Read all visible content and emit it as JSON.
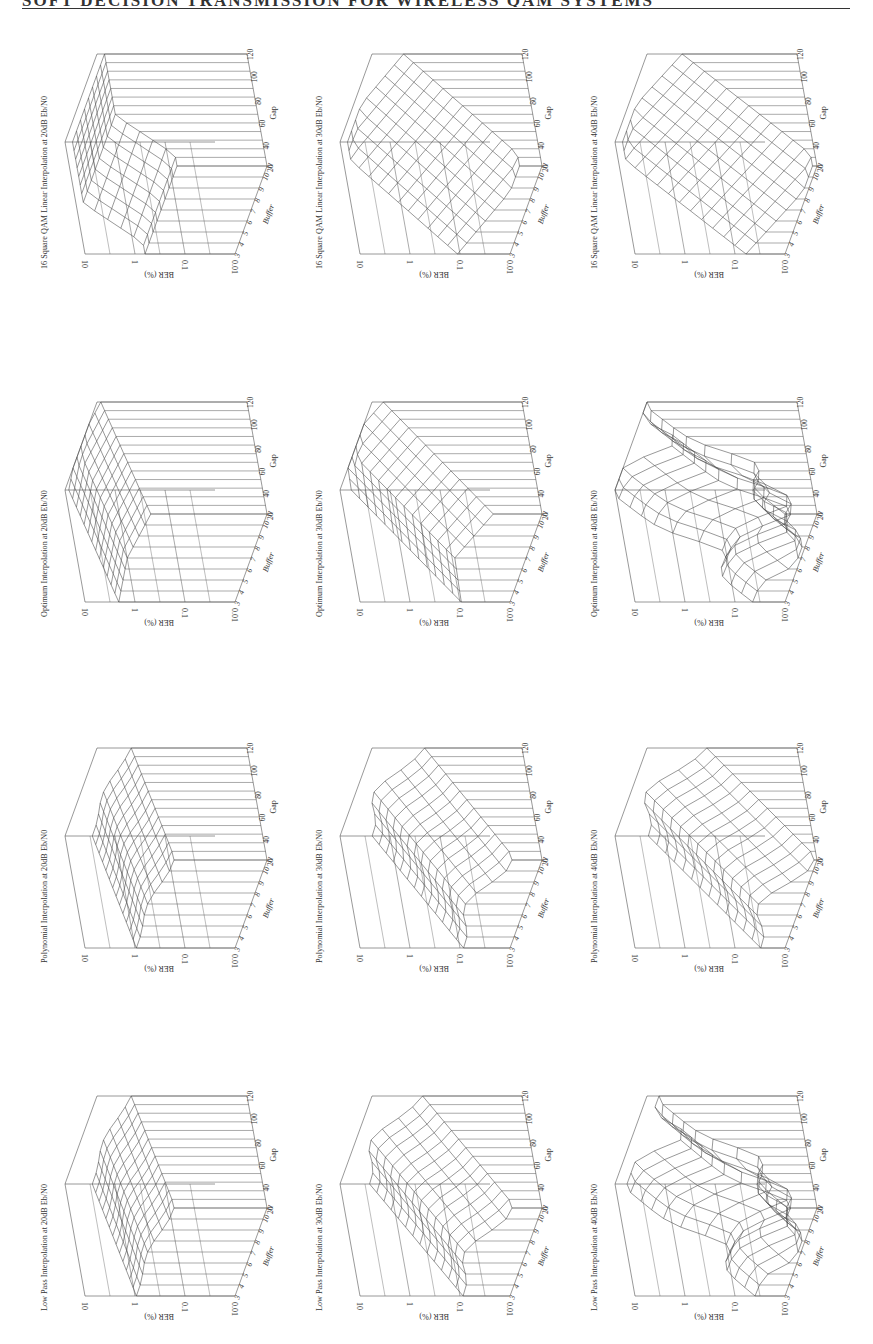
{
  "page": {
    "running_header": "SOFT DECISION TRANSMISSION FOR WIRELESS QAM SYSTEMS",
    "orientation": "landscape-rotated-90"
  },
  "axes": {
    "z_label": "BER (%)",
    "z_ticks": [
      "10",
      "1",
      "0.1",
      "0.01"
    ],
    "x_label": "Buffer",
    "x_ticks": [
      "3",
      "4",
      "5",
      "6",
      "7",
      "8",
      "9",
      "10",
      "11"
    ],
    "y_label": "Gap",
    "y_ticks": [
      "20",
      "40",
      "60",
      "80",
      "100",
      "120"
    ]
  },
  "plots": [
    {
      "id": "qam-20",
      "title": "16 Square QAM Linear Interpolation at 20dB Eb/N0",
      "row": 0,
      "col": 0,
      "origin": [
        35,
        44
      ],
      "floor": 0.6,
      "peak": 0.95,
      "shape": "plateau"
    },
    {
      "id": "qam-30",
      "title": "16 Square QAM Linear Interpolation at 30dB Eb/N0",
      "row": 0,
      "col": 1,
      "origin": [
        310,
        44
      ],
      "floor": 0.15,
      "peak": 0.95,
      "shape": "ramp"
    },
    {
      "id": "qam-40",
      "title": "16 Square QAM Linear Interpolation at 40dB Eb/N0",
      "row": 0,
      "col": 2,
      "origin": [
        585,
        44
      ],
      "floor": 0.03,
      "peak": 0.95,
      "shape": "ramp"
    },
    {
      "id": "opt-20",
      "title": "Optimum Interpolation at 20dB Eb/N0",
      "row": 1,
      "col": 0,
      "origin": [
        35,
        392
      ],
      "floor": 0.75,
      "peak": 1.0,
      "shape": "ridge"
    },
    {
      "id": "opt-30",
      "title": "Optimum Interpolation at 30dB Eb/N0",
      "row": 1,
      "col": 1,
      "origin": [
        310,
        392
      ],
      "floor": 0.25,
      "peak": 1.0,
      "shape": "ridge"
    },
    {
      "id": "opt-40",
      "title": "Optimum Interpolation at 40dB Eb/N0",
      "row": 1,
      "col": 2,
      "origin": [
        585,
        392
      ],
      "floor": 0.02,
      "peak": 1.0,
      "shape": "valley"
    },
    {
      "id": "poly-20",
      "title": "Polynomial Interpolation at 20dB Eb/N0",
      "row": 2,
      "col": 0,
      "origin": [
        35,
        738
      ],
      "floor": 0.62,
      "peak": 0.85,
      "shape": "hump"
    },
    {
      "id": "poly-30",
      "title": "Polynomial Interpolation at 30dB Eb/N0",
      "row": 2,
      "col": 1,
      "origin": [
        310,
        738
      ],
      "floor": 0.2,
      "peak": 0.88,
      "shape": "hump"
    },
    {
      "id": "poly-40",
      "title": "Polynomial Interpolation at 40dB Eb/N0",
      "row": 2,
      "col": 2,
      "origin": [
        585,
        738
      ],
      "floor": 0.02,
      "peak": 0.9,
      "shape": "hump"
    },
    {
      "id": "lp-20",
      "title": "Low Pass Interpolation at 20dB Eb/N0",
      "row": 3,
      "col": 0,
      "origin": [
        35,
        1086
      ],
      "floor": 0.62,
      "peak": 0.85,
      "shape": "hump"
    },
    {
      "id": "lp-30",
      "title": "Low Pass Interpolation at 30dB Eb/N0",
      "row": 3,
      "col": 1,
      "origin": [
        310,
        1086
      ],
      "floor": 0.2,
      "peak": 0.9,
      "shape": "hump"
    },
    {
      "id": "lp-40",
      "title": "Low Pass Interpolation at 40dB Eb/N0",
      "row": 3,
      "col": 2,
      "origin": [
        585,
        1086
      ],
      "floor": 0.02,
      "peak": 0.92,
      "shape": "valley"
    }
  ],
  "chart_data": [
    {
      "type": "surface3d",
      "title": "16 Square QAM Linear Interpolation at 20dB Eb/N0",
      "xlabel": "Buffer",
      "ylabel": "Gap",
      "zlabel": "BER (%)",
      "x": [
        3,
        4,
        5,
        6,
        7,
        8,
        9,
        10,
        11
      ],
      "y": [
        20,
        40,
        60,
        80,
        100,
        120
      ],
      "zscale": "log",
      "zlim": [
        0.01,
        10
      ],
      "approx_range": [
        0.5,
        3
      ]
    },
    {
      "type": "surface3d",
      "title": "16 Square QAM Linear Interpolation at 30dB Eb/N0",
      "xlabel": "Buffer",
      "ylabel": "Gap",
      "zlabel": "BER (%)",
      "x": [
        3,
        4,
        5,
        6,
        7,
        8,
        9,
        10,
        11
      ],
      "y": [
        20,
        40,
        60,
        80,
        100,
        120
      ],
      "zscale": "log",
      "zlim": [
        0.01,
        10
      ],
      "approx_range": [
        0.06,
        3
      ]
    },
    {
      "type": "surface3d",
      "title": "16 Square QAM Linear Interpolation at 40dB Eb/N0",
      "xlabel": "Buffer",
      "ylabel": "Gap",
      "zlabel": "BER (%)",
      "x": [
        3,
        4,
        5,
        6,
        7,
        8,
        9,
        10,
        11
      ],
      "y": [
        20,
        40,
        60,
        80,
        100,
        120
      ],
      "zscale": "log",
      "zlim": [
        0.01,
        10
      ],
      "approx_range": [
        0.01,
        3
      ]
    },
    {
      "type": "surface3d",
      "title": "Optimum Interpolation at 20dB Eb/N0",
      "xlabel": "Buffer",
      "ylabel": "Gap",
      "zlabel": "BER (%)",
      "x": [
        3,
        4,
        5,
        6,
        7,
        8,
        9,
        10,
        11
      ],
      "y": [
        20,
        40,
        60,
        80,
        100,
        120
      ],
      "zscale": "log",
      "zlim": [
        0.01,
        10
      ],
      "approx_range": [
        1,
        10
      ]
    },
    {
      "type": "surface3d",
      "title": "Optimum Interpolation at 30dB Eb/N0",
      "xlabel": "Buffer",
      "ylabel": "Gap",
      "zlabel": "BER (%)",
      "x": [
        3,
        4,
        5,
        6,
        7,
        8,
        9,
        10,
        11
      ],
      "y": [
        20,
        40,
        60,
        80,
        100,
        120
      ],
      "zscale": "log",
      "zlim": [
        0.01,
        10
      ],
      "approx_range": [
        0.1,
        10
      ]
    },
    {
      "type": "surface3d",
      "title": "Optimum Interpolation at 40dB Eb/N0",
      "xlabel": "Buffer",
      "ylabel": "Gap",
      "zlabel": "BER (%)",
      "x": [
        3,
        4,
        5,
        6,
        7,
        8,
        9,
        10,
        11
      ],
      "y": [
        20,
        40,
        60,
        80,
        100,
        120
      ],
      "zscale": "log",
      "zlim": [
        0.01,
        10
      ],
      "approx_range": [
        0.01,
        10
      ]
    },
    {
      "type": "surface3d",
      "title": "Polynomial Interpolation at 20dB Eb/N0",
      "xlabel": "Buffer",
      "ylabel": "Gap",
      "zlabel": "BER (%)",
      "x": [
        3,
        4,
        5,
        6,
        7,
        8,
        9,
        10,
        11
      ],
      "y": [
        20,
        40,
        60,
        80,
        100,
        120
      ],
      "zscale": "log",
      "zlim": [
        0.01,
        10
      ],
      "approx_range": [
        0.8,
        3
      ]
    },
    {
      "type": "surface3d",
      "title": "Polynomial Interpolation at 30dB Eb/N0",
      "xlabel": "Buffer",
      "ylabel": "Gap",
      "zlabel": "BER (%)",
      "x": [
        3,
        4,
        5,
        6,
        7,
        8,
        9,
        10,
        11
      ],
      "y": [
        20,
        40,
        60,
        80,
        100,
        120
      ],
      "zscale": "log",
      "zlim": [
        0.01,
        10
      ],
      "approx_range": [
        0.1,
        3
      ]
    },
    {
      "type": "surface3d",
      "title": "Polynomial Interpolation at 40dB Eb/N0",
      "xlabel": "Buffer",
      "ylabel": "Gap",
      "zlabel": "BER (%)",
      "x": [
        3,
        4,
        5,
        6,
        7,
        8,
        9,
        10,
        11
      ],
      "y": [
        20,
        40,
        60,
        80,
        100,
        120
      ],
      "zscale": "log",
      "zlim": [
        0.01,
        10
      ],
      "approx_range": [
        0.01,
        4
      ]
    },
    {
      "type": "surface3d",
      "title": "Low Pass Interpolation at 20dB Eb/N0",
      "xlabel": "Buffer",
      "ylabel": "Gap",
      "zlabel": "BER (%)",
      "x": [
        3,
        4,
        5,
        6,
        7,
        8,
        9,
        10,
        11
      ],
      "y": [
        20,
        40,
        60,
        80,
        100,
        120
      ],
      "zscale": "log",
      "zlim": [
        0.01,
        10
      ],
      "approx_range": [
        0.8,
        3
      ]
    },
    {
      "type": "surface3d",
      "title": "Low Pass Interpolation at 30dB Eb/N0",
      "xlabel": "Buffer",
      "ylabel": "Gap",
      "zlabel": "BER (%)",
      "x": [
        3,
        4,
        5,
        6,
        7,
        8,
        9,
        10,
        11
      ],
      "y": [
        20,
        40,
        60,
        80,
        100,
        120
      ],
      "zscale": "log",
      "zlim": [
        0.01,
        10
      ],
      "approx_range": [
        0.1,
        4
      ]
    },
    {
      "type": "surface3d",
      "title": "Low Pass Interpolation at 40dB Eb/N0",
      "xlabel": "Buffer",
      "ylabel": "Gap",
      "zlabel": "BER (%)",
      "x": [
        3,
        4,
        5,
        6,
        7,
        8,
        9,
        10,
        11
      ],
      "y": [
        20,
        40,
        60,
        80,
        100,
        120
      ],
      "zscale": "log",
      "zlim": [
        0.01,
        10
      ],
      "approx_range": [
        0.01,
        5
      ]
    }
  ]
}
